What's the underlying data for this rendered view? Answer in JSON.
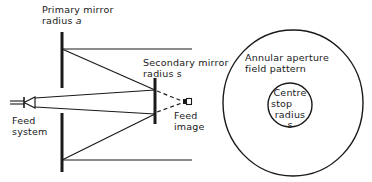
{
  "diagram": {
    "type": "cassegrain-antenna-schematic",
    "colors": {
      "line": "#1a1a1a",
      "background": "#ffffff"
    },
    "labels": {
      "primary_mirror_line1": "Primary mirror",
      "primary_mirror_line2": "radius ",
      "primary_mirror_var": "a",
      "secondary_mirror_line1": "Secondary mirror",
      "secondary_mirror_line2": "radius s",
      "feed_system_line1": "Feed",
      "feed_system_line2": "system",
      "feed_image_line1": "Feed",
      "feed_image_line2": "image",
      "annular_line1": "Annular aperture",
      "annular_line2": "field pattern",
      "centre_line1": "Centre",
      "centre_line2": "stop",
      "centre_line3": "radius",
      "centre_line4": "s"
    }
  }
}
